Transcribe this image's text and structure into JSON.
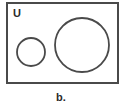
{
  "diagram": {
    "type": "venn",
    "universe_label": "U",
    "caption": "b.",
    "stroke_color": "#4a4a4a",
    "background": "#ffffff",
    "universe_rect": {
      "x": 7,
      "y": 3,
      "width": 111,
      "height": 80
    },
    "sets": [
      {
        "name": "small-circle",
        "cx": 31,
        "cy": 52,
        "r": 14
      },
      {
        "name": "large-circle",
        "cx": 82,
        "cy": 45,
        "r": 27
      }
    ],
    "relationship": "disjoint"
  }
}
